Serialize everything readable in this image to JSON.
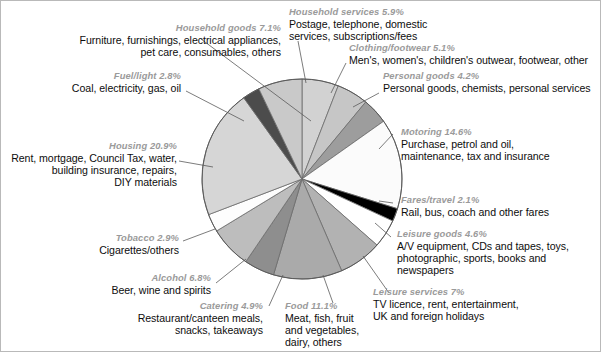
{
  "chart_data": {
    "type": "pie",
    "title": "",
    "xlabel": "",
    "ylabel": "",
    "legend_position": "callout-labels",
    "grid": false,
    "start_angle_deg": 0,
    "direction": "clockwise",
    "categories": [
      "Household services",
      "Clothing/footwear",
      "Personal goods",
      "Motoring",
      "Fares/travel",
      "Leisure goods",
      "Leisure services",
      "Food",
      "Catering",
      "Alcohol",
      "Tobacco",
      "Housing",
      "Fuel/light",
      "Household goods"
    ],
    "values": [
      5.9,
      5.1,
      4.2,
      14.6,
      2.1,
      4.6,
      7.0,
      11.1,
      4.9,
      6.8,
      2.9,
      20.9,
      2.8,
      7.1
    ],
    "value_labels": [
      "5.9%",
      "5.1%",
      "4.2%",
      "14.6%",
      "2.1%",
      "4.6%",
      "7%",
      "11.1%",
      "4.9%",
      "6.8%",
      "2.9%",
      "20.9%",
      "2.8%",
      "7.1%"
    ],
    "colors": [
      "#d2d2d2",
      "#c6c6c6",
      "#9d9d9d",
      "#fbfbfb",
      "#000000",
      "#ffffff",
      "#b2b2b2",
      "#aaaaaa",
      "#8e8e8e",
      "#bdbdbd",
      "#fdfdfd",
      "#d6d6d6",
      "#4c4c4c",
      "#c9c9c9"
    ],
    "descriptions": [
      "Postage, telephone, domestic services, subscriptions/fees",
      "Men's, women's, children's outwear, footwear, other",
      "Personal goods, chemists, personal services",
      "Purchase, petrol and oil, maintenance, tax and insurance",
      "Rail, bus, coach and other fares",
      "A/V equipment, CDs and tapes, toys, photographic, sports, books and newspapers",
      "TV licence, rent, entertainment, UK and foreign holidays",
      "Meat, fish, fruit and vegetables, dairy, others",
      "Restaurant/canteen meals, snacks, takeaways",
      "Beer, wine and spirits",
      "Cigarettes/others",
      "Rent, mortgage, Council Tax, water, building insurance, repairs, DIY materials",
      "Coal, electricity, gas, oil",
      "Furniture, furnishings, electrical appliances, pet care, consumables, others"
    ]
  },
  "labels": {
    "household_goods": {
      "heading": "Household goods 7.1%",
      "line1": "Furniture, furnishings, electrical appliances,",
      "line2": "pet care, consumables, others"
    },
    "fuel_light": {
      "heading": "Fuel/light 2.8%",
      "line1": "Coal, electricity, gas, oil"
    },
    "housing": {
      "heading": "Housing 20.9%",
      "line1": "Rent, mortgage, Council Tax, water,",
      "line2": "building insurance, repairs,",
      "line3": "DIY materials"
    },
    "tobacco": {
      "heading": "Tobacco 2.9%",
      "line1": "Cigarettes/others"
    },
    "alcohol": {
      "heading": "Alcohol 6.8%",
      "line1": "Beer, wine and spirits"
    },
    "catering": {
      "heading": "Catering 4.9%",
      "line1": "Restaurant/canteen meals,",
      "line2": "snacks, takeaways"
    },
    "food": {
      "heading": "Food 11.1%",
      "line1": "Meat, fish, fruit",
      "line2": "and vegetables,",
      "line3": "dairy, others"
    },
    "household_services": {
      "heading": "Household services 5.9%",
      "line1": "Postage, telephone, domestic",
      "line2": "services, subscriptions/fees"
    },
    "clothing_footwear": {
      "heading": "Clothing/footwear 5.1%",
      "line1": "Men's, women's, children's outwear, footwear, other"
    },
    "personal_goods": {
      "heading": "Personal goods 4.2%",
      "line1": "Personal goods, chemists, personal services"
    },
    "motoring": {
      "heading": "Motoring 14.6%",
      "line1": "Purchase, petrol and oil,",
      "line2": "maintenance, tax and insurance"
    },
    "fares_travel": {
      "heading": "Fares/travel 2.1%",
      "line1": "Rail, bus, coach and other fares"
    },
    "leisure_goods": {
      "heading": "Leisure goods 4.6%",
      "line1": "A/V equipment, CDs and tapes, toys,",
      "line2": "photographic, sports, books and",
      "line3": "newspapers"
    },
    "leisure_services": {
      "heading": "Leisure services 7%",
      "line1": "TV licence, rent, entertainment,",
      "line2": "UK and foreign holidays"
    }
  }
}
